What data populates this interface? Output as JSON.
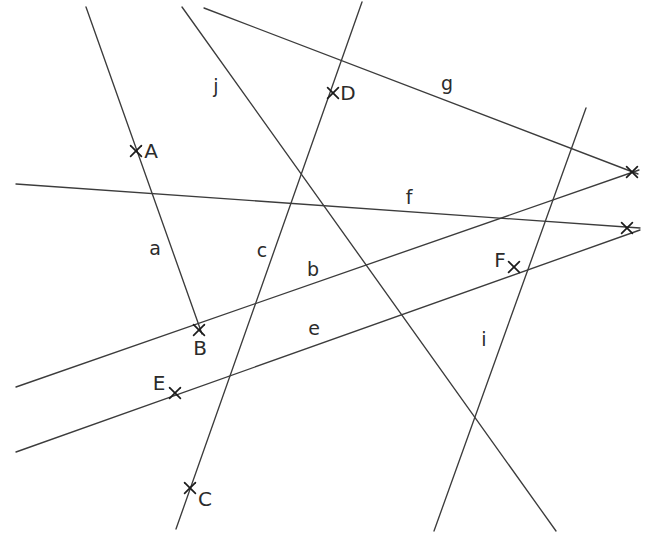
{
  "figure": {
    "kind": "line-arrangement-diagram",
    "background_color": "#ffffff",
    "line_color": "#3c3c3c",
    "mark_color": "#1c1c1c",
    "label_color": "#2b2b2b",
    "width": 646,
    "height": 550
  },
  "lines": [
    {
      "id": "a",
      "label": "a",
      "label_x": 155,
      "label_y": 249,
      "x1": 86,
      "y1": 7,
      "x2": 202,
      "y2": 334
    },
    {
      "id": "j",
      "label": "j",
      "label_x": 216,
      "label_y": 87,
      "x1": 182,
      "y1": 7,
      "x2": 556,
      "y2": 531
    },
    {
      "id": "g",
      "label": "g",
      "label_x": 447,
      "label_y": 84,
      "x1": 204,
      "y1": 8,
      "x2": 638,
      "y2": 174
    },
    {
      "id": "c",
      "label": "c",
      "label_x": 262,
      "label_y": 251,
      "x1": 362,
      "y1": 2,
      "x2": 176,
      "y2": 529
    },
    {
      "id": "f",
      "label": "f",
      "label_x": 409,
      "label_y": 198,
      "x1": 16,
      "y1": 184,
      "x2": 640,
      "y2": 228
    },
    {
      "id": "b",
      "label": "b",
      "label_x": 313,
      "label_y": 270,
      "x1": 16,
      "y1": 387,
      "x2": 639,
      "y2": 170
    },
    {
      "id": "e",
      "label": "e",
      "label_x": 314,
      "label_y": 329,
      "x1": 16,
      "y1": 452,
      "x2": 640,
      "y2": 230
    },
    {
      "id": "i",
      "label": "i",
      "label_x": 484,
      "label_y": 340,
      "x1": 586,
      "y1": 108,
      "x2": 434,
      "y2": 531
    }
  ],
  "points": [
    {
      "id": "A",
      "label": "A",
      "x": 136,
      "y": 151,
      "label_x": 151,
      "label_y": 152
    },
    {
      "id": "D",
      "label": "D",
      "x": 333,
      "y": 93,
      "label_x": 348,
      "label_y": 94
    },
    {
      "id": "B",
      "label": "B",
      "x": 199,
      "y": 330,
      "label_x": 200,
      "label_y": 349
    },
    {
      "id": "F",
      "label": "F",
      "x": 514,
      "y": 267,
      "label_x": 500,
      "label_y": 261
    },
    {
      "id": "E",
      "label": "E",
      "x": 175,
      "y": 393,
      "label_x": 159,
      "label_y": 384
    },
    {
      "id": "C",
      "label": "C",
      "x": 190,
      "y": 488,
      "label_x": 205,
      "label_y": 500
    },
    {
      "id": "P1",
      "label": "",
      "x": 632,
      "y": 172,
      "label_x": 0,
      "label_y": 0
    },
    {
      "id": "P2",
      "label": "",
      "x": 627,
      "y": 228,
      "label_x": 0,
      "label_y": 0
    }
  ]
}
